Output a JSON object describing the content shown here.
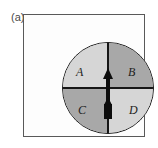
{
  "figure": {
    "panel_label": "(a)",
    "frame": {
      "border_color": "#595959",
      "background": "#fdfdfd"
    },
    "disc": {
      "outline_color": "#1a1a1a",
      "divider_color": "#161616"
    },
    "quadrants": [
      {
        "id": "a",
        "label": "A",
        "fill": "#d6d6d6",
        "shade": "light"
      },
      {
        "id": "b",
        "label": "B",
        "fill": "#a8a8a8",
        "shade": "dark"
      },
      {
        "id": "c",
        "label": "C",
        "fill": "#a8a8a8",
        "shade": "dark"
      },
      {
        "id": "d",
        "label": "D",
        "fill": "#d6d6d6",
        "shade": "light"
      }
    ],
    "arrows": {
      "up_arrow_color": "#0d0d0d",
      "tail_arrow_color": "#0d0d0d",
      "direction": "up"
    }
  }
}
